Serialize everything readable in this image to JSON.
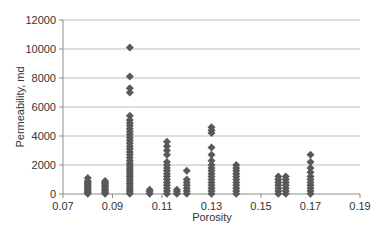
{
  "chart_data": {
    "type": "scatter",
    "title": "",
    "xlabel": "Porosity",
    "ylabel": "Permeability, md",
    "xlim": [
      0.07,
      0.19
    ],
    "ylim": [
      0,
      12000
    ],
    "x_ticks": [
      "0.07",
      "0.09",
      "0.11",
      "0.13",
      "0.15",
      "0.17",
      "0.19"
    ],
    "y_ticks": [
      "0",
      "2000",
      "4000",
      "6000",
      "8000",
      "10000",
      "12000"
    ],
    "grid": {
      "horizontal": true,
      "vertical": false
    },
    "legend": null,
    "marker": {
      "shape": "diamond",
      "color": "#595959"
    },
    "series": [
      {
        "name": "Samples",
        "columns": [
          {
            "x": 0.08,
            "values": [
              20,
              100,
              200,
              300,
              400,
              500,
              600,
              700,
              800,
              900,
              1100
            ]
          },
          {
            "x": 0.087,
            "values": [
              20,
              100,
              200,
              300,
              400,
              500,
              600,
              700,
              800,
              900
            ]
          },
          {
            "x": 0.097,
            "values": [
              20,
              150,
              300,
              450,
              600,
              750,
              900,
              1050,
              1200,
              1350,
              1500,
              1650,
              1800,
              1950,
              2100,
              2300,
              2500,
              2700,
              2900,
              3100,
              3300,
              3500,
              3700,
              3900,
              4100,
              4300,
              4500,
              4700,
              4900,
              5100,
              5400,
              7000,
              7300,
              8100,
              10100
            ]
          },
          {
            "x": 0.105,
            "values": [
              20,
              150,
              300
            ]
          },
          {
            "x": 0.112,
            "values": [
              20,
              200,
              400,
              600,
              800,
              1000,
              1200,
              1400,
              1600,
              1800,
              2000,
              2200,
              2700,
              3000,
              3300,
              3600
            ]
          },
          {
            "x": 0.116,
            "values": [
              20,
              150,
              300
            ]
          },
          {
            "x": 0.12,
            "values": [
              20,
              200,
              400,
              600,
              800,
              1000,
              1600
            ]
          },
          {
            "x": 0.13,
            "values": [
              20,
              200,
              400,
              600,
              800,
              1000,
              1200,
              1400,
              1600,
              1800,
              2000,
              2300,
              2700,
              3200,
              4200,
              4400,
              4600
            ]
          },
          {
            "x": 0.14,
            "values": [
              20,
              200,
              400,
              600,
              800,
              1000,
              1200,
              1400,
              1600,
              1800,
              2000
            ]
          },
          {
            "x": 0.157,
            "values": [
              20,
              200,
              400,
              600,
              800,
              1000,
              1200
            ]
          },
          {
            "x": 0.16,
            "values": [
              20,
              200,
              400,
              600,
              800,
              1000,
              1200
            ]
          },
          {
            "x": 0.17,
            "values": [
              20,
              200,
              400,
              600,
              800,
              1000,
              1200,
              1500,
              1800,
              2200,
              2700
            ]
          }
        ]
      }
    ]
  }
}
